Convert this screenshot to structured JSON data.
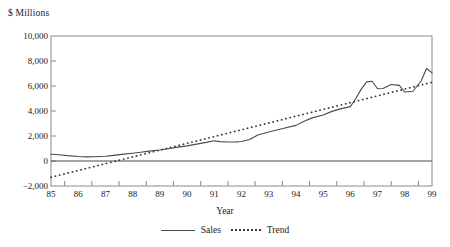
{
  "chart_data": {
    "type": "line",
    "title": "",
    "ylabel": "$ Millions",
    "xlabel": "Year",
    "grid": false,
    "legend_position": "bottom",
    "ylim": [
      -2000,
      10000
    ],
    "ytick_labels": [
      "10,000",
      "8,000",
      "6,000",
      "4,000",
      "2,000",
      "0",
      "−2,000"
    ],
    "ytick_values": [
      10000,
      8000,
      6000,
      4000,
      2000,
      0,
      -2000
    ],
    "xtick_labels": [
      "85",
      "86",
      "87",
      "88",
      "89",
      "90",
      "91",
      "92",
      "93",
      "94",
      "95",
      "96",
      "97",
      "98",
      "99"
    ],
    "x": [
      85,
      86,
      87,
      88,
      89,
      90,
      91,
      92,
      93,
      94,
      95,
      96,
      97,
      98,
      99
    ],
    "series": [
      {
        "name": "Sales",
        "style": "solid",
        "color": "#4a4a4a",
        "x": [
          85.0,
          85.3,
          85.6,
          86.0,
          86.3,
          86.6,
          87.0,
          87.3,
          87.6,
          88.0,
          88.3,
          88.6,
          89.0,
          89.3,
          89.6,
          90.0,
          90.3,
          90.6,
          91.0,
          91.2,
          91.5,
          91.8,
          92.0,
          92.3,
          92.6,
          93.0,
          93.3,
          93.6,
          94.0,
          94.3,
          94.6,
          95.0,
          95.3,
          95.6,
          96.0,
          96.2,
          96.4,
          96.6,
          96.8,
          97.0,
          97.2,
          97.5,
          97.8,
          98.0,
          98.3,
          98.6,
          98.8,
          99.0
        ],
        "values": [
          540,
          500,
          430,
          360,
          330,
          340,
          380,
          450,
          530,
          620,
          700,
          790,
          880,
          980,
          1090,
          1210,
          1330,
          1450,
          1620,
          1550,
          1520,
          1530,
          1560,
          1720,
          2080,
          2320,
          2480,
          2640,
          2850,
          3180,
          3450,
          3680,
          3950,
          4150,
          4350,
          5000,
          5750,
          6330,
          6380,
          5780,
          5800,
          6120,
          6050,
          5520,
          5580,
          6400,
          7400,
          7050
        ]
      },
      {
        "name": "Trend",
        "style": "dotted",
        "color": "#3a3a3a",
        "x": [
          85,
          99
        ],
        "values": [
          -1300,
          6300
        ]
      }
    ]
  }
}
